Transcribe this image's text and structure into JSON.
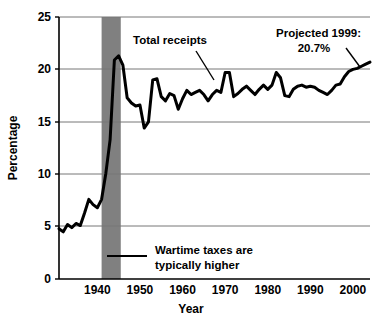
{
  "chart_data": {
    "type": "line",
    "title": "",
    "subtitle": "",
    "xlabel": "Year",
    "ylabel": "Percentage",
    "xlim": [
      1931,
      2004
    ],
    "ylim": [
      0,
      25
    ],
    "xticks": [
      1940,
      1950,
      1960,
      1970,
      1980,
      1990,
      2000
    ],
    "xtick_labels": [
      "1940",
      "1950",
      "1960",
      "1970",
      "1980",
      "1990",
      "2000"
    ],
    "yticks": [
      0,
      5,
      10,
      15,
      20,
      25
    ],
    "ytick_labels": [
      "0",
      "5",
      "10",
      "15",
      "20",
      "25"
    ],
    "grid": "horizontal",
    "legend_position": "none",
    "line_color": "#000000",
    "line_width": 3,
    "series": [
      {
        "name": "Total receipts",
        "x": [
          1931,
          1932,
          1933,
          1934,
          1935,
          1936,
          1937,
          1938,
          1939,
          1940,
          1941,
          1942,
          1943,
          1944,
          1945,
          1946,
          1947,
          1948,
          1949,
          1950,
          1951,
          1952,
          1953,
          1954,
          1955,
          1956,
          1957,
          1958,
          1959,
          1960,
          1961,
          1962,
          1963,
          1964,
          1965,
          1966,
          1967,
          1968,
          1969,
          1970,
          1971,
          1972,
          1973,
          1974,
          1975,
          1976,
          1977,
          1978,
          1979,
          1980,
          1981,
          1982,
          1983,
          1984,
          1985,
          1986,
          1987,
          1988,
          1989,
          1990,
          1991,
          1992,
          1993,
          1994,
          1995,
          1996,
          1997,
          1998,
          1999,
          2000,
          2001,
          2002,
          2003,
          2004
        ],
        "values": [
          4.8,
          4.5,
          5.2,
          4.9,
          5.3,
          5.1,
          6.3,
          7.6,
          7.1,
          6.8,
          7.6,
          10.1,
          13.3,
          20.9,
          21.3,
          20.4,
          17.3,
          16.8,
          16.5,
          16.6,
          14.4,
          15.0,
          19.0,
          19.1,
          17.4,
          17.0,
          17.7,
          17.5,
          16.2,
          17.2,
          18.0,
          17.6,
          17.8,
          18.0,
          17.6,
          17.0,
          17.6,
          18.0,
          17.8,
          19.7,
          19.7,
          17.4,
          17.7,
          18.1,
          18.4,
          18.0,
          17.6,
          18.1,
          18.5,
          18.1,
          18.5,
          19.7,
          19.2,
          17.5,
          17.4,
          18.1,
          18.4,
          18.5,
          18.3,
          18.4,
          18.3,
          18.0,
          17.8,
          17.6,
          18.0,
          18.5,
          18.6,
          19.3,
          19.8,
          20.0,
          20.1,
          20.3,
          20.5,
          20.7
        ]
      }
    ],
    "shaded_regions": [
      {
        "name": "wartime-band",
        "x_start": 1941,
        "x_end": 1945.5,
        "color": "#808080"
      }
    ],
    "annotations": [
      {
        "name": "total-receipts-annotation",
        "text": "Total receipts",
        "lines": [
          "Total receipts"
        ]
      },
      {
        "name": "projected-annotation",
        "text": "Projected 1999: 20.7%",
        "lines": [
          "Projected 1999:",
          "20.7%"
        ]
      },
      {
        "name": "wartime-annotation",
        "text": "Wartime taxes are typically higher",
        "lines": [
          "Wartime taxes are",
          "typically higher"
        ]
      }
    ]
  }
}
